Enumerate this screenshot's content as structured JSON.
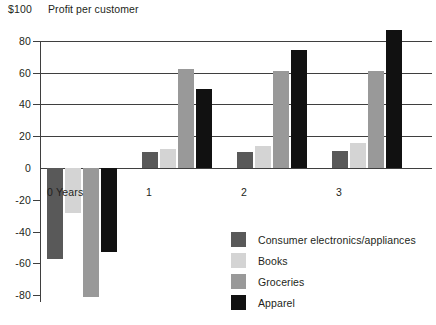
{
  "header": {
    "unit_label": "$100",
    "title": "Profit per customer"
  },
  "axis": {
    "y_ticks": [
      "80",
      "60",
      "40",
      "20",
      "0",
      "-20",
      "-40",
      "-60",
      "-80"
    ],
    "x_ticks": [
      "0 Years",
      "1",
      "2",
      "3"
    ]
  },
  "legend": {
    "items": [
      {
        "label": "Consumer electronics/appliances",
        "color": "#595959"
      },
      {
        "label": "Books",
        "color": "#d4d4d4"
      },
      {
        "label": "Groceries",
        "color": "#999999"
      },
      {
        "label": "Apparel",
        "color": "#111111"
      }
    ]
  },
  "chart_data": {
    "type": "bar",
    "title": "Profit per customer",
    "subtitle": "",
    "xlabel": "Years",
    "ylabel": "$100",
    "categories": [
      "0 Years",
      "1",
      "2",
      "3"
    ],
    "ylim": [
      -90,
      90
    ],
    "yticks": [
      80,
      60,
      40,
      20,
      0,
      -20,
      -40,
      -60,
      -80
    ],
    "grid": true,
    "legend_position": "bottom-right",
    "series": [
      {
        "name": "Consumer electronics/appliances",
        "color": "#595959",
        "values": [
          -57,
          10,
          10,
          11
        ]
      },
      {
        "name": "Books",
        "color": "#d4d4d4",
        "values": [
          -28,
          12,
          14,
          16
        ]
      },
      {
        "name": "Groceries",
        "color": "#999999",
        "values": [
          -81,
          62,
          61,
          61
        ]
      },
      {
        "name": "Apparel",
        "color": "#111111",
        "values": [
          -53,
          50,
          74,
          87
        ]
      }
    ]
  }
}
